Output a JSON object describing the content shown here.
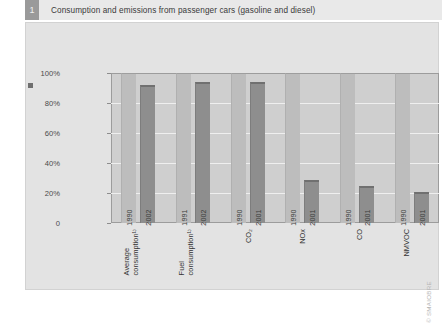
{
  "header": {
    "badge": "1",
    "title": "Consumption and emissions from passenger cars (gasoline and diesel)"
  },
  "credit": "© SMAIOBRE",
  "chart_data": {
    "type": "bar",
    "title": "Consumption and emissions from passenger cars (gasoline and diesel)",
    "xlabel": "",
    "ylabel": "",
    "ylim": [
      0,
      100
    ],
    "ytick_labels": [
      "0",
      "20%",
      "40%",
      "60%",
      "80%",
      "100%"
    ],
    "ytick_values": [
      0,
      20,
      40,
      60,
      80,
      100
    ],
    "grid": true,
    "legend": "none",
    "categories": [
      "Average consumption¹⁾",
      "Fuel consumption¹⁾",
      "CO2",
      "NOx",
      "CO",
      "NMVOC"
    ],
    "groups": [
      {
        "label_line1": "Average",
        "label_line2": "consumption¹⁾",
        "bars": [
          {
            "year": "1990",
            "value": 100,
            "shade": "light"
          },
          {
            "year": "2002",
            "value": 92,
            "shade": "dark"
          }
        ]
      },
      {
        "label_line1": "Fuel",
        "label_line2": "consumption¹⁾",
        "bars": [
          {
            "year": "1991",
            "value": 100,
            "shade": "light"
          },
          {
            "year": "2002",
            "value": 94,
            "shade": "dark"
          }
        ]
      },
      {
        "label_line1": "CO₂",
        "label_line2": "",
        "bars": [
          {
            "year": "1990",
            "value": 100,
            "shade": "light"
          },
          {
            "year": "2001",
            "value": 94,
            "shade": "dark"
          }
        ]
      },
      {
        "label_line1": "NOx",
        "label_line2": "",
        "bars": [
          {
            "year": "1990",
            "value": 100,
            "shade": "light"
          },
          {
            "year": "2001",
            "value": 29,
            "shade": "dark"
          }
        ]
      },
      {
        "label_line1": "CO",
        "label_line2": "",
        "bars": [
          {
            "year": "1990",
            "value": 100,
            "shade": "light"
          },
          {
            "year": "2001",
            "value": 25,
            "shade": "dark"
          }
        ]
      },
      {
        "label_line1": "NMVOC",
        "label_line2": "",
        "bars": [
          {
            "year": "1990",
            "value": 100,
            "shade": "light"
          },
          {
            "year": "2001",
            "value": 21,
            "shade": "dark"
          }
        ]
      }
    ],
    "colors": {
      "bar_light": "#bdbdbd",
      "bar_dark": "#8e8e8e",
      "plot_background": "#cfcfcf",
      "card_background": "#e3e3e3",
      "header_background": "#e9e9e9",
      "badge": "#9a9a9a"
    }
  }
}
